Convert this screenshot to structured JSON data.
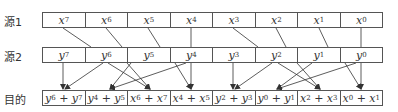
{
  "labels": {
    "src1": "源1",
    "src2": "源2",
    "dest": "目的"
  },
  "src1": [
    {
      "v": "x",
      "i": "7"
    },
    {
      "v": "x",
      "i": "6"
    },
    {
      "v": "x",
      "i": "5"
    },
    {
      "v": "x",
      "i": "4"
    },
    {
      "v": "x",
      "i": "3"
    },
    {
      "v": "x",
      "i": "2"
    },
    {
      "v": "x",
      "i": "1"
    },
    {
      "v": "x",
      "i": "0"
    }
  ],
  "src2": [
    {
      "v": "y",
      "i": "7"
    },
    {
      "v": "y",
      "i": "6"
    },
    {
      "v": "y",
      "i": "5"
    },
    {
      "v": "y",
      "i": "4"
    },
    {
      "v": "y",
      "i": "3"
    },
    {
      "v": "y",
      "i": "2"
    },
    {
      "v": "y",
      "i": "1"
    },
    {
      "v": "y",
      "i": "0"
    }
  ],
  "dest": [
    {
      "a": "y",
      "ai": "6",
      "b": "y",
      "bi": "7"
    },
    {
      "a": "y",
      "ai": "4",
      "b": "y",
      "bi": "5"
    },
    {
      "a": "x",
      "ai": "6",
      "b": "x",
      "bi": "7"
    },
    {
      "a": "x",
      "ai": "4",
      "b": "x",
      "bi": "5"
    },
    {
      "a": "y",
      "ai": "2",
      "b": "y",
      "bi": "3"
    },
    {
      "a": "y",
      "ai": "0",
      "b": "y",
      "bi": "1"
    },
    {
      "a": "x",
      "ai": "2",
      "b": "x",
      "bi": "3"
    },
    {
      "a": "x",
      "ai": "0",
      "b": "x",
      "bi": "1"
    }
  ],
  "colors": {
    "line": "#333333",
    "border": "#555555"
  }
}
